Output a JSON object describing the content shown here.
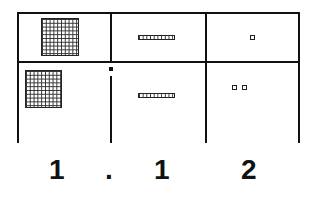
{
  "diagram": {
    "columns": [
      "ones",
      "tenths",
      "hundredths"
    ],
    "rows": [
      {
        "ones": {
          "flats": 1
        },
        "tenths": {
          "rods": 1
        },
        "hundredths": {
          "units": 1
        }
      },
      {
        "ones": {
          "flats": 1
        },
        "tenths": {
          "rods": 1
        },
        "hundredths": {
          "units": 2
        }
      }
    ],
    "number": {
      "digit_ones": "1",
      "decimal_point": ".",
      "digit_tenths": "1",
      "digit_hundredths": "2"
    }
  }
}
